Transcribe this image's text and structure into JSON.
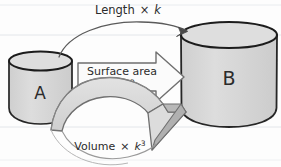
{
  "page": {
    "background_color": "#fdfdfd",
    "ruled_line_color": "#e3e6ea",
    "ink_color": "#2b2b2b"
  },
  "shapes": {
    "cylinder_a": {
      "label": "A",
      "fill_color": "#d6d6d6",
      "top_fill_color": "#dcdcdc",
      "outline_color": "#262626"
    },
    "cylinder_b": {
      "label": "B",
      "fill_color": "#d6d6d6",
      "top_fill_color": "#dcdcdc",
      "outline_color": "#262626"
    }
  },
  "arrows": {
    "length": {
      "label_text": "Length",
      "label_operator": "×",
      "label_factor": "k",
      "label_exponent": "",
      "style": "thin-curved",
      "stroke_color": "#555555"
    },
    "surface_area": {
      "label_text": "Surface area",
      "label_operator": "×",
      "label_factor": "k",
      "label_exponent": "2",
      "style": "block-outline",
      "fill_color": "#fbfbfb",
      "stroke_color": "#6f6f6f"
    },
    "volume": {
      "label_text": "Volume",
      "label_operator": "×",
      "label_factor": "k",
      "label_exponent": "3",
      "style": "block-3d-curved",
      "fill_color": "#d9d9d9",
      "side_fill_color": "#b4b4b4",
      "stroke_color": "#6f6f6f"
    }
  },
  "ruled_lines": [
    {
      "y": 5
    },
    {
      "y": 35
    },
    {
      "y": 127
    },
    {
      "y": 160
    }
  ]
}
